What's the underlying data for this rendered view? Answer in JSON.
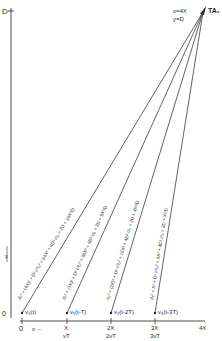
{
  "diagram": {
    "type": "geometry-ray-diagram",
    "axes": {
      "vertical_top_label": "D",
      "vertical_axis_label": "y",
      "origin_label": "0",
      "horizontal_origin_label": "0",
      "horizontal_direction_label": "x ←",
      "horizontal_end_label": "4X"
    },
    "apex": {
      "label": "TA₁",
      "coord_x": "x=4X",
      "coord_y": "y=D"
    },
    "ticks": [
      {
        "top": "X",
        "bottom": "vT"
      },
      {
        "top": "2X",
        "bottom": "2vT"
      },
      {
        "top": "3X",
        "bottom": "3vT"
      }
    ],
    "rays": [
      {
        "source": "v₀(t)",
        "label": "d₀² = (4X)² + D²   c²t₀² = 64X² + 4D²   ct₀ = 2D + 16X²/D"
      },
      {
        "source": "v₁(t-T)",
        "label": "d₁² = (3X)² + D²   c²t₁² = 36X² + 4D²   ct₁ = 2D + 9X²/D"
      },
      {
        "source": "v₂(t-2T)",
        "label": "d₂² = (2X)² + D²   c²t₂² = 16X² + 4D²   ct₂ = 2D + 4X²/D"
      },
      {
        "source": "v₃(t-3T)",
        "label": "d₃² = X² + D²   c²t₃² = 4X² + 4D²   ct₃ = 2D + X²/D"
      }
    ],
    "colors": {
      "line": "#3a3a3a",
      "background": "#ffffff"
    }
  }
}
